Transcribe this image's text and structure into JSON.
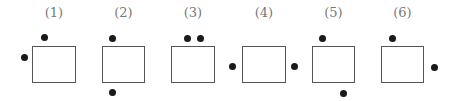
{
  "figures": [
    {
      "label": "(1)",
      "box": {
        "x": 32,
        "y": 46,
        "w": 44,
        "h": 37
      },
      "dots": [
        {
          "x": 44,
          "y": 37,
          "pos": "top-left"
        },
        {
          "x": 24,
          "y": 57,
          "pos": "left"
        }
      ]
    },
    {
      "label": "(2)",
      "box": {
        "x": 102,
        "y": 46,
        "w": 43,
        "h": 37
      },
      "dots": [
        {
          "x": 112,
          "y": 38,
          "pos": "top-left"
        },
        {
          "x": 112,
          "y": 92,
          "pos": "bottom-left"
        }
      ]
    },
    {
      "label": "(3)",
      "box": {
        "x": 171,
        "y": 46,
        "w": 44,
        "h": 37
      },
      "dots": [
        {
          "x": 187,
          "y": 38,
          "pos": "top"
        },
        {
          "x": 200,
          "y": 38,
          "pos": "top"
        }
      ]
    },
    {
      "label": "(4)",
      "box": {
        "x": 242,
        "y": 46,
        "w": 44,
        "h": 37
      },
      "dots": [
        {
          "x": 232,
          "y": 66,
          "pos": "left"
        },
        {
          "x": 294,
          "y": 66,
          "pos": "right"
        }
      ]
    },
    {
      "label": "(5)",
      "box": {
        "x": 312,
        "y": 46,
        "w": 43,
        "h": 37
      },
      "dots": [
        {
          "x": 322,
          "y": 38,
          "pos": "top-left"
        },
        {
          "x": 343,
          "y": 93,
          "pos": "bottom-right"
        }
      ]
    },
    {
      "label": "(6)",
      "box": {
        "x": 381,
        "y": 46,
        "w": 43,
        "h": 37
      },
      "dots": [
        {
          "x": 392,
          "y": 38,
          "pos": "top-left"
        },
        {
          "x": 434,
          "y": 67,
          "pos": "right"
        }
      ]
    }
  ],
  "colors": {
    "box_border": "#555555",
    "dot": "#1a1a1a",
    "label": "#777777"
  }
}
